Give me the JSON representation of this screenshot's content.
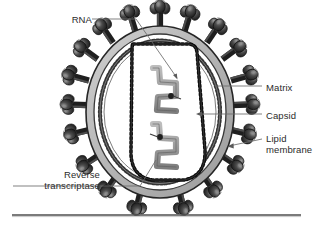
{
  "figure": {
    "type": "diagram",
    "background_color": "#ffffff",
    "text_color": "#2b2b2b",
    "rule": {
      "present": true,
      "x1": 12,
      "x2": 301,
      "y": 215,
      "color": "#555555"
    }
  },
  "labels": {
    "rna": "RNA",
    "reverse_transcriptase_line1": "Reverse",
    "reverse_transcriptase_line2": "transcriptase",
    "matrix": "Matrix",
    "capsid": "Capsid",
    "lipid_line1": "Lipid",
    "lipid_line2": "membrane"
  },
  "structures": {
    "spike_count": 19,
    "envelope": {
      "outer_stroke": "#2a2a2a",
      "lipid_band_fill": "#b8b8b8",
      "inner_stroke": "#3a3a3a",
      "cx": 160,
      "cy": 112,
      "rx": 74,
      "ry": 86
    },
    "matrix": {
      "description": "beaded inner ring",
      "bead_color": "#3a3a3a",
      "rx": 60,
      "ry": 71
    },
    "capsid": {
      "description": "rounded trapezoid with dotted outline",
      "outline_color": "#111111",
      "fill": "#ffffff"
    },
    "rna_strands": {
      "count": 2,
      "color": "#9a9a9a",
      "stroke": "#4a4a4a"
    },
    "reverse_transcriptase_dots": 2,
    "spike": {
      "head_color_dark": "#2e2e2e",
      "head_color_light": "#8a8a8a",
      "stalk_color": "#222222"
    }
  },
  "leader_lines": {
    "rna": {
      "from": [
        92,
        19
      ],
      "to": [
        176,
        78
      ],
      "elbow": [
        136,
        19
      ]
    },
    "rt": {
      "from": [
        103,
        186
      ],
      "to": [
        152,
        158
      ],
      "elbow": [
        140,
        186
      ]
    },
    "matrix": {
      "from": [
        262,
        86
      ],
      "to": [
        214,
        86
      ]
    },
    "capsid": {
      "from": [
        262,
        114
      ],
      "to": [
        196,
        114
      ],
      "arrow": true
    },
    "lipid": {
      "from": [
        262,
        139
      ],
      "to": [
        228,
        146
      ],
      "arrow": true
    }
  }
}
